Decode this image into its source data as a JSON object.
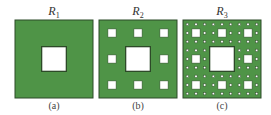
{
  "figure": {
    "panels": [
      {
        "id": "a",
        "title": "R",
        "subscript": "1",
        "caption": "(a)",
        "level": 1,
        "left": 14
      },
      {
        "id": "b",
        "title": "R",
        "subscript": "2",
        "caption": "(b)",
        "level": 2,
        "left": 98
      },
      {
        "id": "c",
        "title": "R",
        "subscript": "3",
        "caption": "(c)",
        "level": 3,
        "left": 182
      }
    ],
    "colors": {
      "fill": "#4f9447",
      "hole": "#ffffff",
      "outline": "#2d4a28"
    }
  }
}
